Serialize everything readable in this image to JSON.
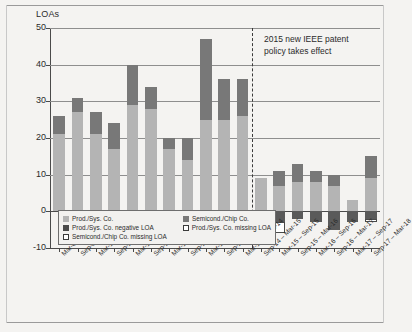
{
  "chart": {
    "axis_title": "LOAs",
    "annotation": "2015 new IEEE patent\npolicy takes effect",
    "legend": [
      {
        "key": "prod",
        "label": "Prod./Sys. Co.",
        "color": "#b4b4b4"
      },
      {
        "key": "semi",
        "label": "Semicond./Chip Co.",
        "color": "#787878"
      },
      {
        "key": "prod_neg",
        "label": "Prod./Sys. Co. negative LOA",
        "color": "#4a4a4a"
      },
      {
        "key": "prod_missing",
        "label": "Prod./Sys. Co. missing LOA",
        "color": "#ffffff"
      },
      {
        "key": "semi_missing",
        "label": "Semicond./Chip Co. missing LOA",
        "color": "#ffffff"
      }
    ]
  },
  "chart_data": {
    "type": "bar",
    "title": "",
    "xlabel": "",
    "ylabel": "LOAs",
    "ylim": [
      -10,
      50
    ],
    "yticks": [
      -10,
      0,
      10,
      20,
      30,
      40,
      50
    ],
    "grid": true,
    "stacked": true,
    "legend_position": "inside-bottom-left",
    "divider_after_category_index": 11,
    "divider_label": "2015 new IEEE patent policy takes effect",
    "categories": [
      "Mar-09 – Sep-09",
      "Sep-09 – Mar-10",
      "Mar-10 – Sep-10",
      "Sep-10 – Mar-11",
      "Mar-11 – Sep-11",
      "Sep-11 – Mar-12",
      "Mar-12 – Sep-12",
      "Sep-12 – Mar-13",
      "Mar-13 – Sep-13",
      "Sep-13 – Mar-14",
      "Mar-14 – Sep-14",
      "Sep-14 – Mar-15",
      "Mar-15 – Sep-15",
      "Sep-15 – Mar-16",
      "Mar-16 – Sep-16",
      "Sep-16 – Mar-17",
      "Mar-17 – Sep-17",
      "Sep-17 – Mar-18"
    ],
    "series": [
      {
        "name": "Prod./Sys. Co.",
        "color": "#b4b4b4",
        "values": [
          21,
          27,
          21,
          17,
          29,
          28,
          17,
          14,
          25,
          25,
          26,
          9,
          7,
          8,
          8,
          7,
          3,
          9
        ]
      },
      {
        "name": "Semicond./Chip Co.",
        "color": "#787878",
        "values": [
          5,
          4,
          6,
          7,
          11,
          6,
          3,
          6,
          22,
          11,
          10,
          0,
          4,
          5,
          3,
          3,
          0,
          6
        ]
      },
      {
        "name": "Prod./Sys. Co. negative LOA",
        "color": "#4a4a4a",
        "values": [
          0,
          0,
          0,
          -1,
          -1,
          0,
          0,
          0,
          0,
          0,
          0,
          0,
          -3,
          -2,
          -3,
          -5,
          -3,
          -2
        ]
      },
      {
        "name": "Prod./Sys. Co. missing LOA",
        "color": "#ffffff",
        "values": [
          0,
          0,
          0,
          0,
          0,
          0,
          0,
          0,
          0,
          0,
          0,
          -1,
          -3,
          0,
          0,
          0,
          0,
          -1
        ]
      },
      {
        "name": "Semicond./Chip Co. missing LOA",
        "color": "#ffffff",
        "values": [
          0,
          0,
          0,
          0,
          0,
          0,
          0,
          0,
          0,
          0,
          0,
          0,
          0,
          0,
          0,
          0,
          0,
          0
        ]
      }
    ],
    "totals": [
      26,
      31,
      27,
      24,
      40,
      34,
      20,
      20,
      47,
      36,
      36,
      9,
      11,
      13,
      11,
      10,
      3,
      15
    ]
  }
}
